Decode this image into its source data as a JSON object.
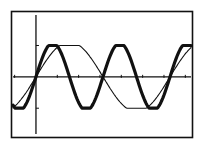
{
  "screen": {
    "background": "#ffffff",
    "ink": "#111111"
  },
  "chart_data": {
    "type": "line",
    "title": "",
    "xlabel": "",
    "ylabel": "",
    "xlim": [
      -1.17,
      7.36
    ],
    "ylim": [
      -1.95,
      2.1
    ],
    "x_tick_step": 1,
    "y_tick_values": [
      -1,
      1
    ],
    "grid": false,
    "legend": null,
    "series": [
      {
        "name": "y1 = sin(2x)",
        "expr": "sin(2x)",
        "style": "thick",
        "stroke_width": 3.2
      },
      {
        "name": "y2 = sin(x)",
        "expr": "sin(x)",
        "style": "thin",
        "stroke_width": 1.1
      }
    ],
    "samples": {
      "x": [
        -1.0,
        -0.5,
        0,
        0.785,
        1.571,
        2.356,
        3.142,
        3.927,
        4.712,
        5.498,
        6.283,
        7.0
      ],
      "y1": [
        -0.91,
        -0.84,
        0,
        1,
        0,
        -1,
        0,
        1,
        0,
        -1,
        0,
        0.99
      ],
      "y2": [
        -0.84,
        -0.48,
        0,
        0.71,
        1,
        0.71,
        0,
        -0.71,
        -1,
        -0.71,
        0,
        0.66
      ]
    }
  }
}
